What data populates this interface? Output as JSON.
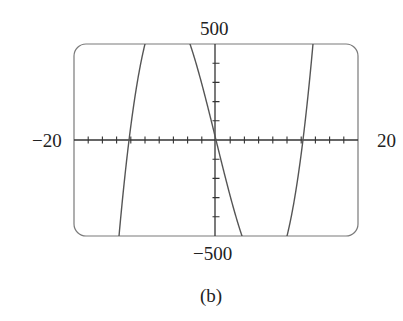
{
  "chart_data": {
    "type": "line",
    "title": "",
    "caption": "(b)",
    "function": "y = x^3 - 150x",
    "xlabel": "",
    "ylabel": "",
    "xlim": [
      -20,
      20
    ],
    "ylim": [
      -500,
      500
    ],
    "x_tick_step": 2,
    "y_tick_step": 100,
    "grid": false,
    "legend": null,
    "axis_labels": {
      "x_min": "−20",
      "x_max": "20",
      "y_max": "500",
      "y_min": "−500"
    },
    "series": [
      {
        "name": "curve",
        "x": [
          -14,
          -13,
          -12.25,
          -12,
          -11,
          -10,
          -8,
          -6,
          -4,
          -3.5,
          -2,
          0,
          2,
          3.5,
          4,
          6,
          8,
          10,
          11,
          12,
          12.25,
          13,
          14
        ],
        "y": [
          -644,
          -353,
          0,
          72,
          319,
          500,
          688,
          684,
          536,
          482,
          292,
          0,
          -292,
          -482,
          -536,
          -684,
          -688,
          -500,
          -319,
          -72,
          0,
          353,
          644
        ]
      }
    ],
    "colors": {
      "curve": "#555555",
      "axes": "#333333",
      "frame": "#777777"
    }
  }
}
